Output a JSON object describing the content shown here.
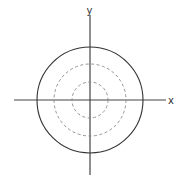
{
  "diagram": {
    "type": "concentric-circles-on-axes",
    "center": [
      90,
      100
    ],
    "axes": {
      "x_label": "x",
      "y_label": "y",
      "color": "#444444",
      "x_extent": [
        14,
        166
      ],
      "y_extent": [
        15,
        175
      ]
    },
    "circles": [
      {
        "name": "outer",
        "r": 53,
        "style": "solid",
        "color": "#333333"
      },
      {
        "name": "middle",
        "r": 36,
        "style": "dashed",
        "color": "#888888"
      },
      {
        "name": "inner",
        "r": 18,
        "style": "dashed",
        "color": "#888888"
      }
    ]
  }
}
